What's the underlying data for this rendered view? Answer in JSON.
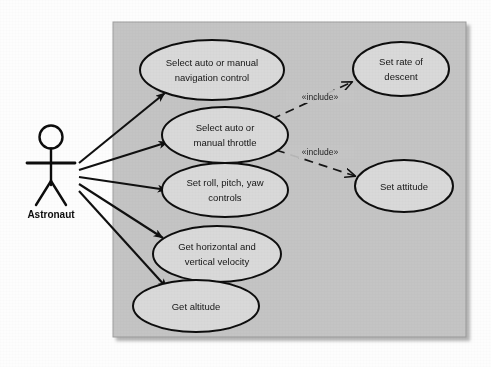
{
  "diagram": {
    "kind": "uml-use-case-diagram",
    "actor": {
      "name": "Astronaut"
    },
    "system_boundary": {
      "fill_color": "#c4c4c4",
      "border_color": "#8f8f8f"
    },
    "style": {
      "ellipse_fill": "#d9d9d9",
      "ellipse_stroke": "#101010",
      "line_color": "#101010",
      "page_background": "#fdfdfd"
    },
    "use_cases": [
      {
        "id": "uc1",
        "label_line1": "Select auto or manual",
        "label_line2": "navigation control",
        "cx": 212,
        "cy": 70,
        "rx": 72,
        "ry": 30
      },
      {
        "id": "uc2",
        "label_line1": "Select auto or",
        "label_line2": "manual throttle",
        "cx": 225,
        "cy": 135,
        "rx": 63,
        "ry": 28
      },
      {
        "id": "uc3",
        "label_line1": "Set roll, pitch, yaw",
        "label_line2": "controls",
        "cx": 225,
        "cy": 190,
        "rx": 63,
        "ry": 27
      },
      {
        "id": "uc4",
        "label_line1": "Get horizontal and",
        "label_line2": "vertical velocity",
        "cx": 217,
        "cy": 254,
        "rx": 64,
        "ry": 28
      },
      {
        "id": "uc5",
        "label_line1": "Get altitude",
        "label_line2": "",
        "cx": 196,
        "cy": 306,
        "rx": 63,
        "ry": 26
      },
      {
        "id": "uc6",
        "label_line1": "Set rate of",
        "label_line2": "descent",
        "cx": 401,
        "cy": 69,
        "rx": 48,
        "ry": 27
      },
      {
        "id": "uc7",
        "label_line1": "Set attitude",
        "label_line2": "",
        "cx": 404,
        "cy": 186,
        "rx": 49,
        "ry": 26
      }
    ],
    "associations": [
      {
        "from": "actor",
        "to": "uc1"
      },
      {
        "from": "actor",
        "to": "uc2"
      },
      {
        "from": "actor",
        "to": "uc3"
      },
      {
        "from": "actor",
        "to": "uc4"
      },
      {
        "from": "actor",
        "to": "uc5"
      }
    ],
    "includes": [
      {
        "from": "uc2",
        "to": "uc6",
        "label": "«include»"
      },
      {
        "from": "uc2",
        "to": "uc7",
        "label": "«include»"
      }
    ]
  }
}
